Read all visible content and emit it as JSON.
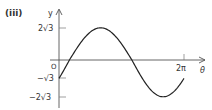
{
  "part_label": "(iii)",
  "chart_data": {
    "type": "line",
    "title": "",
    "xlabel": "θ",
    "ylabel": "y",
    "function": "y = 2√3 sin(θ − π/6)",
    "x_range": [
      0,
      6.2832
    ],
    "ylim": [
      -3.4641,
      3.4641
    ],
    "x_ticks": [
      {
        "value": 6.2832,
        "label": "2π"
      }
    ],
    "y_ticks": [
      {
        "value": 3.4641,
        "label": "2√3"
      },
      {
        "value": 0,
        "label": "O"
      },
      {
        "value": -1.7321,
        "label": "−√3"
      },
      {
        "value": -3.4641,
        "label": "−2√3"
      }
    ],
    "x": [
      0,
      0.5236,
      2.0944,
      3.6652,
      5.236,
      6.2832
    ],
    "values": [
      -1.7321,
      0,
      3.4641,
      0,
      -3.4641,
      -1.7321
    ],
    "key_points": [
      {
        "x": "0",
        "y": "−√3"
      },
      {
        "x": "π/6",
        "y": "0"
      },
      {
        "x": "2π/3",
        "y": "2√3",
        "note": "maximum"
      },
      {
        "x": "7π/6",
        "y": "0"
      },
      {
        "x": "5π/3",
        "y": "−2√3",
        "note": "minimum"
      },
      {
        "x": "2π",
        "y": "−√3"
      }
    ],
    "grid": false,
    "legend": null,
    "colors": {
      "curve": "#222222",
      "axes": "#555555",
      "text": "#333333"
    }
  }
}
